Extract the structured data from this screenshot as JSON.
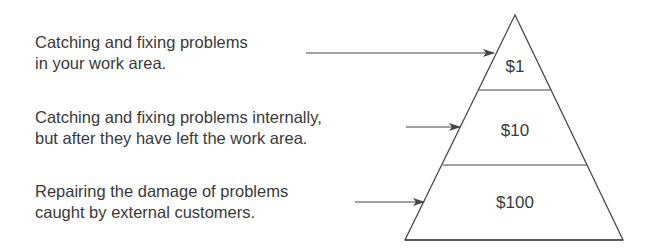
{
  "diagram": {
    "type": "cost-of-quality-pyramid",
    "levels": [
      {
        "description_lines": [
          "Catching and fixing problems",
          "in your work area."
        ],
        "cost": "$1"
      },
      {
        "description_lines": [
          "Catching and fixing problems internally,",
          "but after they have left the work area."
        ],
        "cost": "$10"
      },
      {
        "description_lines": [
          "Repairing the damage of problems",
          "caught by external customers."
        ],
        "cost": "$100"
      }
    ],
    "colors": {
      "line": "#444444",
      "text": "#3a3a3a",
      "background": "#ffffff"
    }
  }
}
